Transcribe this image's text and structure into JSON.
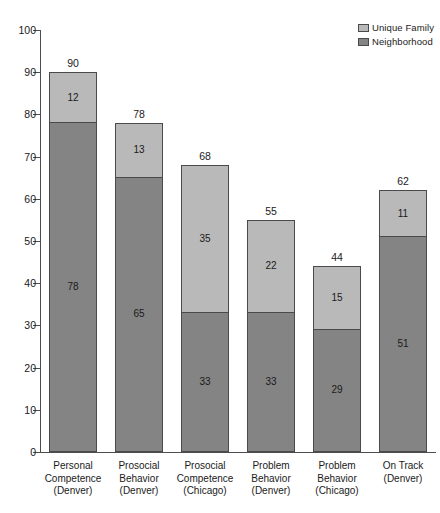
{
  "chart_data": {
    "type": "bar",
    "subtype": "stacked-bar",
    "title": "",
    "subtitle": "",
    "xlabel": "",
    "ylabel": "",
    "ylim": [
      0,
      100
    ],
    "y_ticks": [
      0,
      10,
      20,
      30,
      40,
      50,
      60,
      70,
      80,
      90,
      100
    ],
    "y_tick_labels": [
      "0",
      "10",
      "20",
      "30",
      "40",
      "50",
      "60",
      "70",
      "80",
      "90",
      "100"
    ],
    "grid": false,
    "legend_position": "top-right",
    "categories": [
      "Personal Competence (Denver)",
      "Prosocial Behavior (Denver)",
      "Prosocial Competence (Chicago)",
      "Problem Behavior (Denver)",
      "Problem Behavior (Chicago)",
      "On Track (Denver)"
    ],
    "category_lines": [
      [
        "Personal",
        "Competence",
        "(Denver)"
      ],
      [
        "Prosocial",
        "Behavior",
        "(Denver)"
      ],
      [
        "Prosocial",
        "Competence",
        "(Chicago)"
      ],
      [
        "Problem",
        "Behavior",
        "(Denver)"
      ],
      [
        "Problem",
        "Behavior",
        "(Chicago)"
      ],
      [
        "On Track",
        "(Denver)"
      ]
    ],
    "series": [
      {
        "name": "Unique Family",
        "color": "#b9b9b9",
        "values": [
          12,
          13,
          35,
          22,
          15,
          11
        ]
      },
      {
        "name": "Neighborhood",
        "color": "#848484",
        "values": [
          78,
          65,
          33,
          33,
          29,
          51
        ]
      }
    ],
    "totals": [
      90,
      78,
      68,
      55,
      44,
      62
    ],
    "total_labels": [
      "90",
      "78",
      "68",
      "55",
      "44",
      "62"
    ]
  },
  "legend": {
    "entries": [
      {
        "label": "Unique Family",
        "color": "#b9b9b9"
      },
      {
        "label": "Neighborhood",
        "color": "#848484"
      }
    ]
  },
  "colors": {
    "unique_family": "#b9b9b9",
    "neighborhood": "#848484",
    "axis": "#4d4d4d",
    "segment_border": "#4a4a4a",
    "text": "#1a1a1a",
    "background": "#ffffff"
  }
}
